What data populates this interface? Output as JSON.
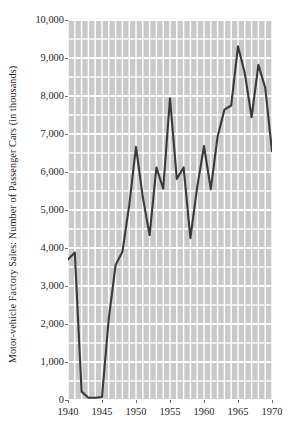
{
  "chart_data": {
    "type": "line",
    "title": "",
    "xlabel": "",
    "ylabel": "Motor-vehicle Factory Sales: Number of Passenger Cars (in thousands)",
    "xlim": [
      1940,
      1970
    ],
    "ylim": [
      0,
      10000
    ],
    "grid": true,
    "legend": "none",
    "y_tick_labels": [
      "10,000",
      "9,000",
      "8,000",
      "7,000",
      "6,000",
      "5,000",
      "4,000",
      "3,000",
      "2,000",
      "1,000",
      "0"
    ],
    "y_tick_values": [
      10000,
      9000,
      8000,
      7000,
      6000,
      5000,
      4000,
      3000,
      2000,
      1000,
      0
    ],
    "y_minor_tick_step": 500,
    "x_tick_labels": [
      "1940",
      "1945",
      "1950",
      "1955",
      "1960",
      "1965",
      "1970"
    ],
    "x_tick_values": [
      1940,
      1945,
      1950,
      1955,
      1960,
      1965,
      1970
    ],
    "x_minor_tick_step": 1,
    "series": [
      {
        "name": "Passenger cars produced (thousands)",
        "color": "#3a3a3a",
        "x": [
          1940,
          1941,
          1942,
          1943,
          1944,
          1945,
          1946,
          1947,
          1948,
          1949,
          1950,
          1951,
          1952,
          1953,
          1954,
          1955,
          1956,
          1957,
          1958,
          1959,
          1960,
          1961,
          1962,
          1963,
          1964,
          1965,
          1966,
          1967,
          1968,
          1969,
          1970
        ],
        "values": [
          3700,
          3880,
          220,
          60,
          60,
          80,
          2150,
          3550,
          3900,
          5120,
          6660,
          5340,
          4340,
          6120,
          5560,
          7940,
          5820,
          6120,
          4260,
          5600,
          6680,
          5550,
          6930,
          7640,
          7750,
          9310,
          8600,
          7440,
          8820,
          8220,
          6550
        ]
      }
    ],
    "colors": {
      "line": "#3a3a3a",
      "plot_background": "#c9c9c9",
      "gridline": "#ffffff",
      "page_background": "#ffffff",
      "text": "#1f1f1f"
    }
  }
}
